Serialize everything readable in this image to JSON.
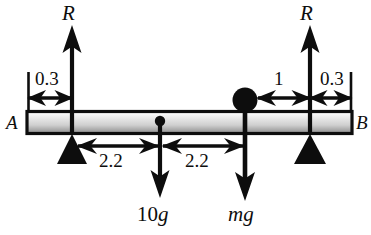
{
  "figure": {
    "type": "free-body-diagram",
    "beam": {
      "left_end_label": "A",
      "right_end_label": "B"
    },
    "forces": [
      {
        "name": "left-reaction",
        "label": "R",
        "direction": "up"
      },
      {
        "name": "right-reaction",
        "label": "R",
        "direction": "up"
      },
      {
        "name": "beam-weight",
        "label": "10g",
        "label_number": "10",
        "label_unit": "g",
        "direction": "down"
      },
      {
        "name": "particle-weight",
        "label": "mg",
        "label_mass": "m",
        "label_unit": "g",
        "direction": "down"
      }
    ],
    "dimensions": [
      {
        "name": "dim-left-overhang",
        "label": "0.3"
      },
      {
        "name": "dim-left-span",
        "label": "2.2"
      },
      {
        "name": "dim-right-span",
        "label": "2.2"
      },
      {
        "name": "dim-particle-to-support",
        "label": "1"
      },
      {
        "name": "dim-right-overhang",
        "label": "0.3"
      }
    ],
    "colors": {
      "ink": "#0d0d0d",
      "beam_light": "#f2f2f2",
      "beam_mid": "#d8d8d8",
      "beam_dark": "#9a9a9a",
      "background": "#ffffff"
    }
  }
}
